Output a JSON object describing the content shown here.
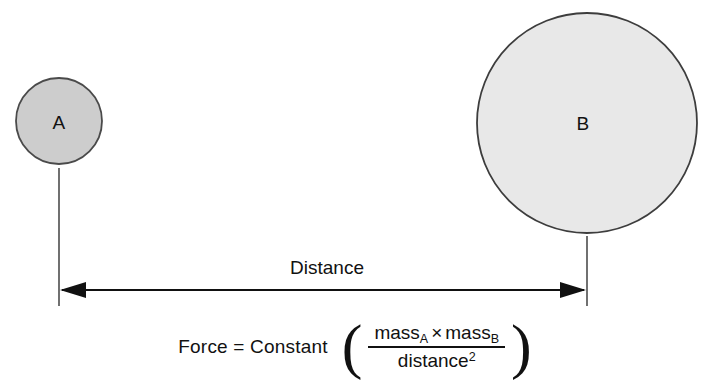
{
  "diagram": {
    "background_color": "#ffffff",
    "bodies": [
      {
        "id": "a",
        "label": "A",
        "role": "small-mass",
        "fill_color": "#cdcdcd",
        "stroke_color": "#4a4a4a",
        "center_x": 59,
        "center_y": 121,
        "radius": 43
      },
      {
        "id": "b",
        "label": "B",
        "role": "large-mass",
        "fill_color": "#e8e8e8",
        "stroke_color": "#3d3d3d",
        "center_x": 587,
        "center_y": 123,
        "radius": 110
      }
    ],
    "measure": {
      "label": "Distance",
      "line_color": "#111111",
      "arrow_y": 290,
      "left_x": 60,
      "right_x": 586,
      "tick_top_left_y": 168,
      "tick_top_right_y": 236,
      "tick_bottom_y": 306
    }
  },
  "formula": {
    "lhs": "Force = Constant",
    "paren_open": "(",
    "paren_close": ")",
    "numerator": {
      "term_one": "mass",
      "term_one_sub": "A",
      "operator": "×",
      "term_two": "mass",
      "term_two_sub": "B"
    },
    "denominator": {
      "term": "distance",
      "exponent": "2"
    },
    "plain_text": "Force = Constant ( massA × massB / distance² )"
  }
}
